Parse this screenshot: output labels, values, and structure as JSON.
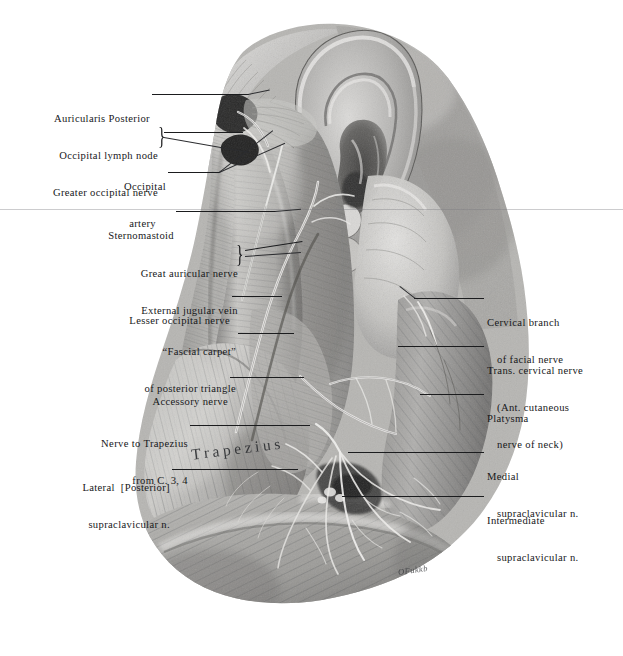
{
  "plate": {
    "title": "Posterior triangle of the neck — superficial dissection",
    "background_color": "#ffffff",
    "ink_color": "#17181a",
    "width": 623,
    "height": 656
  },
  "in_illustration": {
    "muscle_name": "Trapezius",
    "signature": "OFukkb"
  },
  "labels_left": [
    {
      "id": "auricularis-posterior",
      "lines": [
        "Auricularis Posterior"
      ],
      "brace": false
    },
    {
      "id": "occipital-lymph-node-greater-occipital-nerve",
      "lines": [
        "Occipital lymph node",
        "Greater occipital nerve"
      ],
      "brace": true
    },
    {
      "id": "occipital-artery",
      "lines": [
        "Occipital",
        "artery"
      ],
      "brace": false
    },
    {
      "id": "sternomastoid",
      "lines": [
        "Sternomastoid"
      ],
      "brace": false
    },
    {
      "id": "great-auricular-nerve-external-jugular-vein",
      "lines": [
        "Great auricular nerve",
        "External jugular vein"
      ],
      "brace": true
    },
    {
      "id": "lesser-occipital-nerve",
      "lines": [
        "Lesser occipital nerve"
      ],
      "brace": false
    },
    {
      "id": "fascial-carpet-of-posterior-triangle",
      "lines": [
        "“Fascial carpet”",
        "of posterior triangle"
      ],
      "brace": false
    },
    {
      "id": "accessory-nerve",
      "lines": [
        "Accessory nerve"
      ],
      "brace": false
    },
    {
      "id": "nerve-to-trapezius-from-c34",
      "lines": [
        "Nerve to Trapezius",
        "from C. 3, 4"
      ],
      "brace": false
    },
    {
      "id": "lateral-posterior-supraclavicular-n",
      "lines": [
        "Lateral  [Posterior]",
        "supraclavicular n."
      ],
      "brace": false
    }
  ],
  "labels_right": [
    {
      "id": "cervical-branch-of-facial-nerve",
      "lines": [
        "Cervical branch",
        "of facial nerve"
      ]
    },
    {
      "id": "trans-cervical-nerve",
      "lines": [
        "Trans. cervical nerve",
        "(Ant. cutaneous",
        "nerve of neck)"
      ]
    },
    {
      "id": "platysma",
      "lines": [
        "Platysma"
      ]
    },
    {
      "id": "medial-supraclavicular-n",
      "lines": [
        "Medial",
        "supraclavicular n."
      ]
    },
    {
      "id": "intermediate-supraclavicular-n",
      "lines": [
        "Intermediate",
        "supraclavicular n."
      ]
    }
  ]
}
